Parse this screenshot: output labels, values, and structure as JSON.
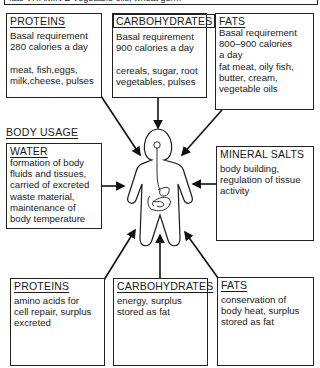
{
  "top_cutoff_text": "fats VITAMIN E  Vegetable oils, wheat germ",
  "sources": {
    "proteins": {
      "title": "PROTEINS",
      "body": "Basal requirement\n280 calories a day\n\nmeat, fish,eggs,\nmilk,cheese, pulses"
    },
    "carbohydrates": {
      "title": "CARBOHYDRATES",
      "body": "Basal requirement\n900 calories a day\n\ncereals, sugar, root\nvegetables, pulses"
    },
    "fats": {
      "title": "FATS",
      "body": "Basal requirement\n800–900 calories\na day\nfat meat, oily fish,\nbutter, cream,\nvegetable oils"
    }
  },
  "section_label": "BODY USAGE",
  "usage": {
    "water": {
      "title": "WATER",
      "body": "formation of body\nfluids and tissues,\ncarried of excreted\nwaste material,\nmaintenance of\nbody temperature"
    },
    "mineral_salts": {
      "title": "MINERAL SALTS",
      "body": "body building,\nregulation of tissue\nactivity"
    },
    "proteins": {
      "title": "PROTEINS",
      "body": "amino acids for\ncell repair, surplus\nexcreted"
    },
    "carbohydrates": {
      "title": "CARBOHYDRATES",
      "body": "energy, surplus\nstored as fat"
    },
    "fats": {
      "title": "FATS",
      "body": "conservation of\nbody heat, surplus\nstored as fat"
    }
  },
  "figure": {
    "icon": "human-body-digestive-system",
    "stroke_color": "#1a1a1a"
  }
}
